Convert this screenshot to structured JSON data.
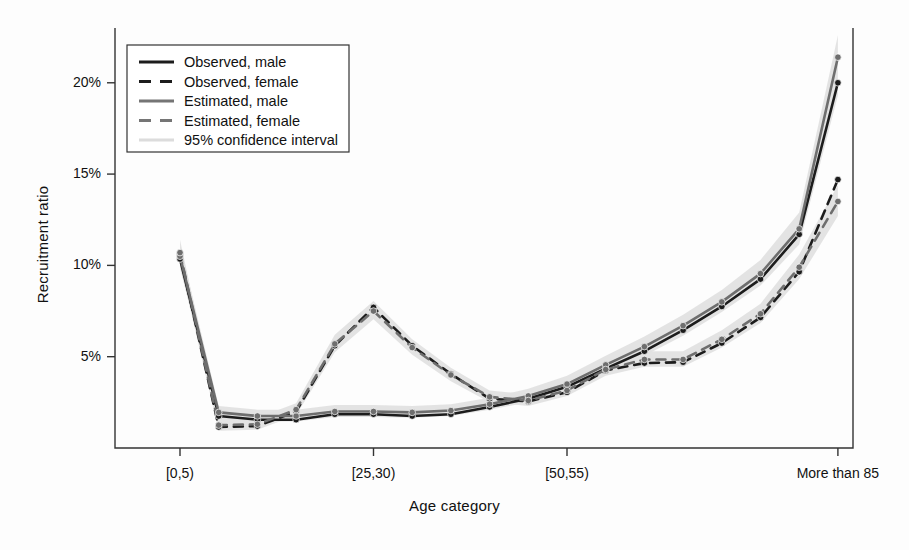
{
  "chart_data": {
    "type": "line",
    "title": "",
    "xlabel": "Age category",
    "ylabel": "Recruitment ratio",
    "ylim": [
      0,
      23
    ],
    "yticks": [
      5,
      10,
      15,
      20
    ],
    "ytick_labels": [
      "5%",
      "10%",
      "15%",
      "20%"
    ],
    "grid": false,
    "legend_position": "top-left",
    "categories": [
      "[0,5)",
      "[5,10)",
      "[10,15)",
      "[15,20)",
      "[20,25)",
      "[25,30)",
      "[30,35)",
      "[35,40)",
      "[40,45)",
      "[45,50)",
      "[50,55)",
      "[55,60)",
      "[60,65)",
      "[65,70)",
      "[70,75)",
      "[75,80)",
      "[80,85)",
      "More than 85"
    ],
    "xtick_labels": [
      "[0,5)",
      "[25,30)",
      "[50,55)",
      "More than 85"
    ],
    "xtick_indices": [
      0,
      5,
      10,
      17
    ],
    "series": [
      {
        "name": "Observed, male",
        "style": "solid",
        "color": "#1c1c1c",
        "values": [
          10.35,
          1.75,
          1.55,
          1.55,
          1.85,
          1.85,
          1.75,
          1.85,
          2.25,
          2.7,
          3.35,
          4.35,
          5.3,
          6.45,
          7.75,
          9.25,
          11.7,
          20.0
        ]
      },
      {
        "name": "Observed, female",
        "style": "dashed",
        "color": "#1c1c1c",
        "values": [
          10.6,
          1.15,
          1.2,
          2.0,
          5.6,
          7.7,
          5.6,
          4.05,
          2.7,
          2.55,
          3.05,
          4.25,
          4.65,
          4.7,
          5.75,
          7.15,
          9.65,
          14.7
        ]
      },
      {
        "name": "Estimated, male",
        "style": "solid",
        "color": "#6e6e6e",
        "values": [
          10.5,
          1.95,
          1.75,
          1.75,
          2.0,
          2.0,
          1.95,
          2.05,
          2.4,
          2.85,
          3.5,
          4.55,
          5.55,
          6.7,
          8.0,
          9.55,
          12.0,
          21.4
        ]
      },
      {
        "name": "Estimated, female",
        "style": "dashed",
        "color": "#6e6e6e",
        "values": [
          10.7,
          1.25,
          1.3,
          2.1,
          5.7,
          7.5,
          5.5,
          4.0,
          2.8,
          2.6,
          3.15,
          4.3,
          4.85,
          4.85,
          5.95,
          7.35,
          9.9,
          13.5
        ]
      }
    ],
    "confidence_bands": [
      {
        "name": "95% confidence interval, male",
        "color": "#e2e2e2",
        "lower": [
          9.85,
          1.6,
          1.45,
          1.45,
          1.7,
          1.7,
          1.65,
          1.75,
          2.1,
          2.5,
          3.1,
          4.1,
          5.05,
          6.15,
          7.45,
          8.9,
          11.15,
          19.3
        ],
        "upper": [
          11.15,
          2.3,
          2.1,
          2.1,
          2.35,
          2.35,
          2.3,
          2.4,
          2.75,
          3.25,
          3.95,
          5.05,
          6.1,
          7.3,
          8.65,
          10.3,
          12.9,
          22.6
        ]
      },
      {
        "name": "95% confidence interval, female",
        "color": "#e2e2e2",
        "lower": [
          10.0,
          0.95,
          1.0,
          1.8,
          5.25,
          7.05,
          5.1,
          3.65,
          2.5,
          2.3,
          2.85,
          3.95,
          4.45,
          4.45,
          5.5,
          6.85,
          9.25,
          12.7
        ],
        "upper": [
          11.4,
          1.6,
          1.65,
          2.45,
          6.2,
          8.05,
          5.95,
          4.4,
          3.15,
          2.95,
          3.5,
          4.7,
          5.3,
          5.3,
          6.45,
          7.9,
          10.6,
          14.4
        ]
      }
    ],
    "legend_items": [
      {
        "label": "Observed, male",
        "color": "#1c1c1c",
        "style": "solid",
        "width": 3.2
      },
      {
        "label": "Observed, female",
        "color": "#1c1c1c",
        "style": "dashed",
        "width": 3.2
      },
      {
        "label": "Estimated, male",
        "color": "#757575",
        "style": "solid",
        "width": 3.2
      },
      {
        "label": "Estimated, female",
        "color": "#757575",
        "style": "dashed",
        "width": 3.2
      },
      {
        "label": "95% confidence interval",
        "color": "#dcdcdc",
        "style": "solid",
        "width": 3.2
      }
    ]
  }
}
